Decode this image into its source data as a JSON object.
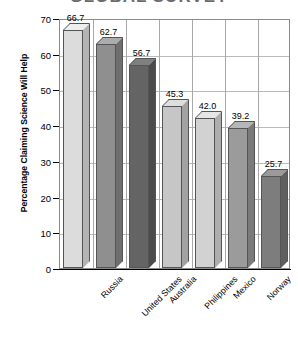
{
  "chart_data": {
    "type": "bar",
    "title": "GLOBAL SURVEY",
    "title_clipped": true,
    "xlabel": "",
    "ylabel": "Percentage Claiming Science Will Help",
    "categories": [
      "Russia",
      "United States",
      "Australia",
      "Philippines",
      "Mexico",
      "Norway",
      "Japan"
    ],
    "values": [
      66.7,
      62.7,
      56.7,
      45.3,
      42.0,
      39.2,
      25.7
    ],
    "value_labels": [
      "66.7",
      "62.7",
      "56.7",
      "45.3",
      "42.0",
      "39.2",
      "25.7"
    ],
    "ylim": [
      0,
      70
    ],
    "ytick_labels": [
      "0",
      "10",
      "20",
      "30",
      "40",
      "50",
      "60",
      "70"
    ],
    "ytick_values": [
      0,
      10,
      20,
      30,
      40,
      50,
      60,
      70
    ],
    "grid": true,
    "legend": "none",
    "style": "3d-bar",
    "bar_colors": [
      "#dcdcdc",
      "#8f8f8f",
      "#646464",
      "#c6c6c6",
      "#d2d2d2",
      "#9b9b9b",
      "#7d7d7d"
    ],
    "bar_top_colors": [
      "#efefef",
      "#acacac",
      "#808080",
      "#dedede",
      "#e6e6e6",
      "#b6b6b6",
      "#9a9a9a"
    ],
    "bar_side_colors": [
      "#b4b4b4",
      "#6e6e6e",
      "#4b4b4b",
      "#a2a2a2",
      "#adadad",
      "#7a7a7a",
      "#5f5f5f"
    ],
    "axis_color": "#000000",
    "grid_color": "#a8a8a8"
  }
}
